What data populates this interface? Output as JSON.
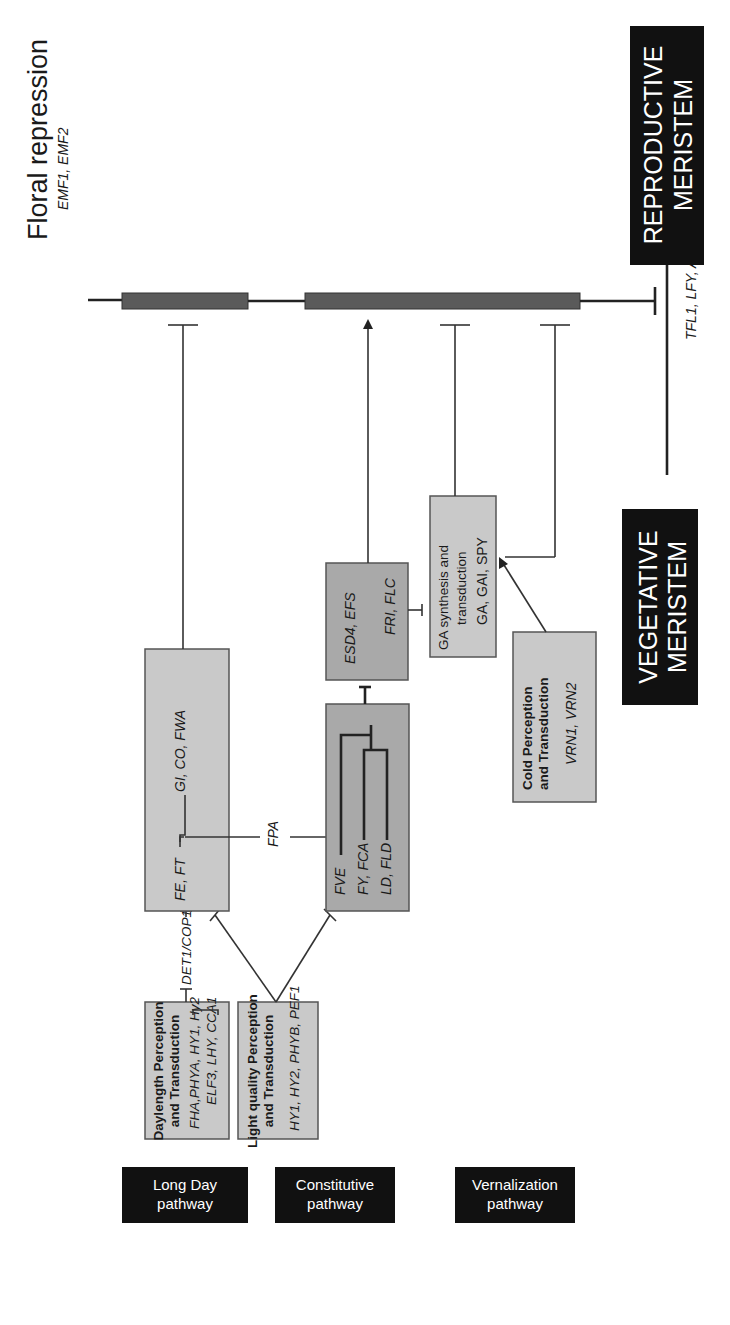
{
  "title": {
    "main": "Floral repression",
    "genes": "EMF1, EMF2"
  },
  "pathway_labels": [
    {
      "line1": "Long Day",
      "line2": "pathway"
    },
    {
      "line1": "Constitutive",
      "line2": "pathway"
    },
    {
      "line1": "Vernalization",
      "line2": "pathway"
    }
  ],
  "boxes": {
    "daylength": {
      "title1": "Daylength Perception",
      "title2": "and Transduction",
      "genes1": "FHA,PHYA, HY1, Hy2",
      "genes2": "ELF3, LHY, CCA1"
    },
    "light_quality": {
      "title1": "Light quality Perception",
      "title2": "and Transduction",
      "genes1": "HY1, HY2, PHYB, PEF1"
    },
    "long_day_core": {
      "genes_a": "FE, FT",
      "genes_b": "GI, CO, FWA"
    },
    "constitutive_core": {
      "gene1": "FVE",
      "gene2": "FY, FCA",
      "gene3": "LD, FLD"
    },
    "esd4": {
      "genes1": "ESD4, EFS",
      "genes2": "FRI, FLC"
    },
    "ga": {
      "title1": "GA synthesis and",
      "title2": "transduction",
      "genes": "GA, GAI, SPY"
    },
    "cold": {
      "title1": "Cold Perception",
      "title2": "and Transduction",
      "genes": "VRN1, VRN2"
    }
  },
  "connectors": {
    "det1_cop1": "DET1/COP1",
    "fpa": "FPA",
    "transition_genes": "TFL1, LFY, AP1"
  },
  "meristems": {
    "vegetative": {
      "line1": "VEGETATIVE",
      "line2": "MERISTEM"
    },
    "reproductive": {
      "line1": "REPRODUCTIVE",
      "line2": "MERISTEM"
    }
  },
  "colors": {
    "box_light": "#c9c9c9",
    "box_medium": "#a9a9a9",
    "bar": "#5a5a5a",
    "label_bg": "#111111"
  }
}
